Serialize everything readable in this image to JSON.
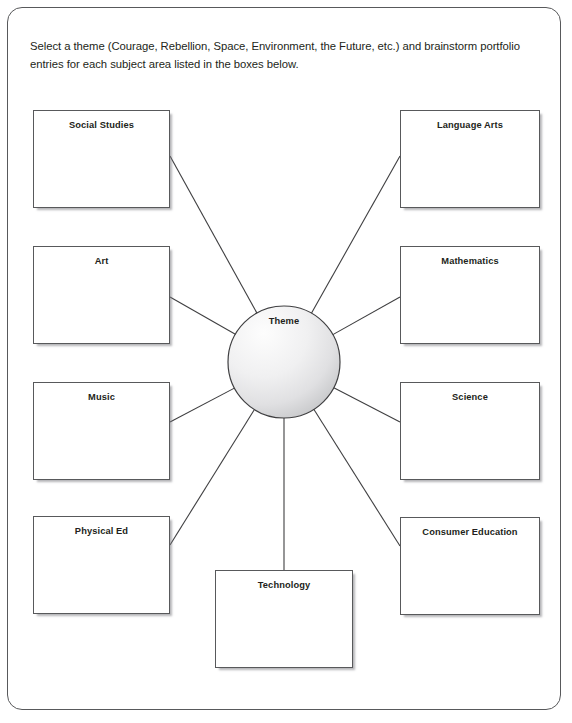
{
  "worksheet": {
    "instructions": "Select a theme (Courage, Rebellion, Space, Environment, the Future, etc.) and brainstorm portfolio entries for each subject area listed in the boxes below.",
    "center_node": {
      "label": "Theme",
      "shape": "circle",
      "cx": 284,
      "cy": 362,
      "r": 56,
      "fill_light": "#fcfcfc",
      "fill_dark": "#cfd0d2",
      "stroke": "#3f3f41"
    },
    "frame": {
      "stroke": "#58595b",
      "radius_px": 15
    },
    "connector": {
      "stroke": "#3f3f41",
      "width_px": 1.1
    },
    "boxes": [
      {
        "id": "social-studies",
        "label": "Social Studies",
        "x": 33,
        "y": 110,
        "w": 137,
        "h": 98,
        "anchor_x": 170,
        "anchor_y": 156
      },
      {
        "id": "art",
        "label": "Art",
        "x": 33,
        "y": 246,
        "w": 137,
        "h": 98,
        "anchor_x": 170,
        "anchor_y": 297
      },
      {
        "id": "music",
        "label": "Music",
        "x": 33,
        "y": 382,
        "w": 137,
        "h": 98,
        "anchor_x": 170,
        "anchor_y": 422
      },
      {
        "id": "physical-ed",
        "label": "Physical Ed",
        "x": 33,
        "y": 516,
        "w": 137,
        "h": 98,
        "anchor_x": 170,
        "anchor_y": 545
      },
      {
        "id": "technology",
        "label": "Technology",
        "x": 215,
        "y": 570,
        "w": 138,
        "h": 98,
        "anchor_x": 284,
        "anchor_y": 570
      },
      {
        "id": "consumer-education",
        "label": "Consumer Education",
        "x": 400,
        "y": 517,
        "w": 140,
        "h": 98,
        "anchor_x": 400,
        "anchor_y": 546
      },
      {
        "id": "science",
        "label": "Science",
        "x": 400,
        "y": 382,
        "w": 140,
        "h": 98,
        "anchor_x": 400,
        "anchor_y": 422
      },
      {
        "id": "mathematics",
        "label": "Mathematics",
        "x": 400,
        "y": 246,
        "w": 140,
        "h": 98,
        "anchor_x": 400,
        "anchor_y": 297
      },
      {
        "id": "language-arts",
        "label": "Language Arts",
        "x": 400,
        "y": 110,
        "w": 140,
        "h": 98,
        "anchor_x": 400,
        "anchor_y": 156
      }
    ]
  }
}
